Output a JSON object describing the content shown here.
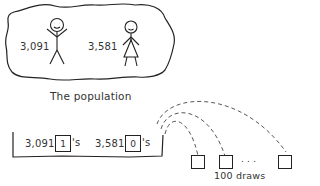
{
  "population": {
    "label": "The population",
    "male_count": "3,091",
    "female_count": "3,581"
  },
  "urn": {
    "ones_count": "3,091",
    "ones_value": "1",
    "ones_suffix": "'s",
    "zeros_count": "3,581",
    "zeros_value": "0",
    "zeros_suffix": "'s"
  },
  "draws": {
    "label": "100 draws",
    "ellipsis": ". . ."
  },
  "colors": {
    "ink": "#222222",
    "background": "#ffffff"
  }
}
